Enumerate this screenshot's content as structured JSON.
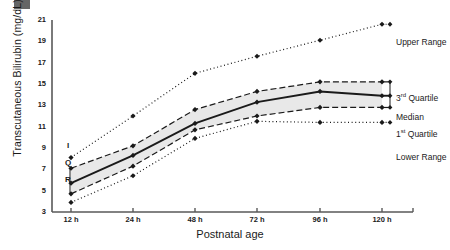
{
  "chart_data": {
    "type": "line",
    "title": "",
    "xlabel": "Postnatal age",
    "ylabel": "Transcutaneous Bilirubin (mg/dL)",
    "categories": [
      "12 h",
      "24 h",
      "48 h",
      "72 h",
      "96 h",
      "120 h"
    ],
    "x_positions": [
      71,
      133,
      195,
      257,
      320,
      382
    ],
    "ylim": [
      3,
      21
    ],
    "yticks": [
      3,
      5,
      7,
      9,
      11,
      13,
      15,
      17,
      19,
      21
    ],
    "grid": false,
    "legend_position": "right",
    "shaded_band": {
      "label": "IQR",
      "between": [
        "1st Quartile",
        "3rd Quartile"
      ],
      "fill": "#e8e8e8"
    },
    "annotations": [
      {
        "text": "I",
        "meaning": "IQR-bracket-letter",
        "x": 63,
        "y": 146
      },
      {
        "text": "Q",
        "meaning": "IQR-bracket-letter",
        "x": 63,
        "y": 163
      },
      {
        "text": "R",
        "meaning": "IQR-bracket-letter",
        "x": 63,
        "y": 180
      }
    ],
    "series": [
      {
        "name": "Upper Range",
        "style": "dotted",
        "marker": "diamond",
        "values": [
          8.1,
          12.0,
          16.0,
          17.6,
          19.1,
          20.6
        ]
      },
      {
        "name": "3rd Quartile",
        "style": "dashed",
        "marker": "diamond",
        "values": [
          7.1,
          9.2,
          12.6,
          14.3,
          15.2,
          15.2
        ]
      },
      {
        "name": "Median",
        "style": "solid",
        "marker": "diamond",
        "values": [
          5.7,
          8.3,
          11.3,
          13.3,
          14.3,
          13.9
        ]
      },
      {
        "name": "1st Quartile",
        "style": "dashed",
        "marker": "diamond",
        "values": [
          4.7,
          7.3,
          10.7,
          12.0,
          12.8,
          12.8
        ]
      },
      {
        "name": "Lower Range",
        "style": "dotted",
        "marker": "diamond",
        "values": [
          3.9,
          6.4,
          9.9,
          11.5,
          11.4,
          11.4
        ]
      }
    ]
  },
  "legend": {
    "upper_range": "Upper Range",
    "third_quartile_num": "3",
    "third_quartile_sup": "rd",
    "third_quartile_rest": "Quartile",
    "median": "Median",
    "first_quartile_num": "1",
    "first_quartile_sup": "st",
    "first_quartile_rest": "Quartile",
    "lower_range": "Lower Range"
  },
  "faint_text": {
    "bottom": "",
    "right": ""
  },
  "colors": {
    "axis": "#595959",
    "line": "#1a1a1a",
    "band": "#e8e8e8",
    "text": "#1a1a1a"
  }
}
